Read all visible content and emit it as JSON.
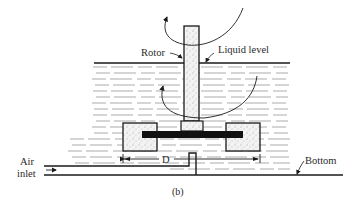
{
  "figure": {
    "caption": "(b)",
    "labels": {
      "rotor": "Rotor",
      "liquid_level": "Liquid level",
      "dimension": "D",
      "air_inlet_line1": "Air",
      "air_inlet_line2": "inlet",
      "bottom": "Bottom"
    },
    "colors": {
      "line": "#1a1a1a",
      "fill_solid": "#111111",
      "stipple_bg": "#f2f2f2",
      "background": "#ffffff"
    }
  }
}
